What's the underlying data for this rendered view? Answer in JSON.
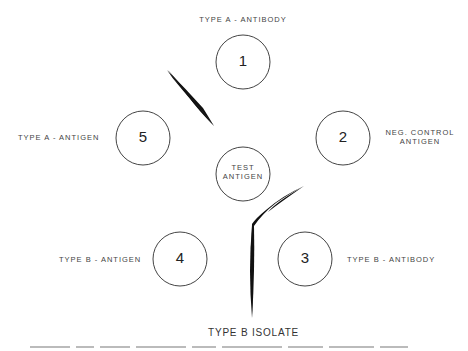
{
  "diagram": {
    "title_caption": "TYPE B ISOLATE",
    "colors": {
      "stroke": "#444444",
      "precipitin": "#111111",
      "text": "#444444"
    },
    "wells": [
      {
        "id": "1",
        "label": "1",
        "cx": 243,
        "cy": 62,
        "r": 27
      },
      {
        "id": "2",
        "label": "2",
        "cx": 343,
        "cy": 138,
        "r": 27
      },
      {
        "id": "3",
        "label": "3",
        "cx": 305,
        "cy": 259,
        "r": 27
      },
      {
        "id": "4",
        "label": "4",
        "cx": 180,
        "cy": 259,
        "r": 27
      },
      {
        "id": "5",
        "label": "5",
        "cx": 143,
        "cy": 138,
        "r": 27
      },
      {
        "id": "test",
        "label_line1": "TEST",
        "label_line2": "ANTIGEN",
        "cx": 243,
        "cy": 174,
        "r": 27
      }
    ],
    "labels": {
      "well1": "TYPE A - ANTIBODY",
      "well2_line1": "NEG. CONTROL",
      "well2_line2": "ANTIGEN",
      "well3": "TYPE B - ANTIBODY",
      "well4": "TYPE B - ANTIGEN",
      "well5": "TYPE A - ANTIGEN"
    },
    "precipitin_lines": [
      {
        "name": "type-a-line",
        "between": [
          "1",
          "5"
        ]
      },
      {
        "name": "type-b-line",
        "between": [
          "3",
          "4",
          "test"
        ]
      }
    ]
  }
}
